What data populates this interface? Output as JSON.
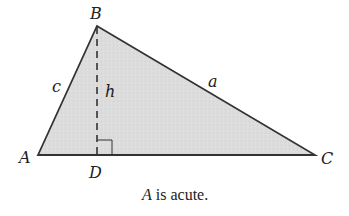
{
  "diagram": {
    "type": "triangle-with-altitude",
    "fill_color": "#d9d9d9",
    "stroke_color": "#333333",
    "vertices": {
      "A": {
        "label": "A",
        "x": 38,
        "y": 155
      },
      "B": {
        "label": "B",
        "x": 97,
        "y": 26
      },
      "C": {
        "label": "C",
        "x": 315,
        "y": 155
      },
      "D": {
        "label": "D",
        "x": 97,
        "y": 155
      }
    },
    "sides": {
      "c": {
        "label": "c",
        "from": "A",
        "to": "B"
      },
      "a": {
        "label": "a",
        "from": "B",
        "to": "C"
      }
    },
    "altitude": {
      "label": "h",
      "from": "B",
      "to": "D",
      "style": "dashed"
    },
    "right_angle_marker": {
      "at": "D"
    }
  },
  "caption": {
    "variable": "A",
    "text": " is acute."
  }
}
